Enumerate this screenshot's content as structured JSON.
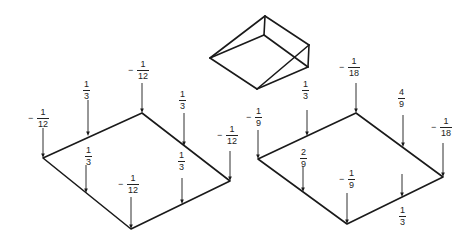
{
  "figure": {
    "wedge": {
      "vertices": {
        "top": [
          265,
          16
        ],
        "inner": [
          264,
          35
        ],
        "left": [
          210,
          58
        ],
        "bottom": [
          257,
          89
        ],
        "right_top": [
          309,
          45
        ],
        "right_bottom": [
          308,
          67
        ]
      },
      "edges": [
        [
          "left",
          "top"
        ],
        [
          "left",
          "inner"
        ],
        [
          "left",
          "bottom"
        ],
        [
          "top",
          "inner"
        ],
        [
          "top",
          "right_top"
        ],
        [
          "inner",
          "right_bottom"
        ],
        [
          "right_top",
          "right_bottom"
        ],
        [
          "bottom",
          "right_top"
        ],
        [
          "bottom",
          "right_bottom"
        ]
      ]
    },
    "plates": [
      {
        "name": "left-plate",
        "corners": {
          "left": [
            43,
            158
          ],
          "top": [
            142,
            113
          ],
          "right": [
            230,
            181
          ],
          "bottom": [
            131,
            229
          ]
        },
        "loads": [
          {
            "id": "left-corner",
            "x": 43,
            "y": 158,
            "arrow_top": 128,
            "sign": "−",
            "num": "1",
            "den": "12",
            "label_x": 28,
            "label_y": 108
          },
          {
            "id": "left-top-mid",
            "x": 88,
            "y": 136,
            "arrow_top": 100,
            "sign": "",
            "num": "1",
            "den": "3",
            "label_x": 83,
            "label_y": 80
          },
          {
            "id": "top-corner",
            "x": 142,
            "y": 113,
            "arrow_top": 83,
            "sign": "−",
            "num": "1",
            "den": "12",
            "label_x": 128,
            "label_y": 60
          },
          {
            "id": "top-right-mid",
            "x": 184,
            "y": 146,
            "arrow_top": 113,
            "sign": "",
            "num": "1",
            "den": "3",
            "label_x": 179,
            "label_y": 90
          },
          {
            "id": "right-corner",
            "x": 230,
            "y": 181,
            "arrow_top": 151,
            "sign": "−",
            "num": "1",
            "den": "12",
            "label_x": 217,
            "label_y": 125
          },
          {
            "id": "left-bottom-mid",
            "x": 86,
            "y": 193,
            "arrow_top": 165,
            "sign": "",
            "num": "1",
            "den": "3",
            "label_x": 85,
            "label_y": 146
          },
          {
            "id": "bottom-corner",
            "x": 131,
            "y": 229,
            "arrow_top": 197,
            "sign": "−",
            "num": "1",
            "den": "12",
            "label_x": 118,
            "label_y": 174
          },
          {
            "id": "bottom-right-mid",
            "x": 182,
            "y": 204,
            "arrow_top": 178,
            "sign": "",
            "num": "1",
            "den": "3",
            "label_x": 178,
            "label_y": 151
          }
        ]
      },
      {
        "name": "right-plate",
        "corners": {
          "left": [
            258,
            159
          ],
          "top": [
            356,
            113
          ],
          "right": [
            443,
            177
          ],
          "bottom": [
            347,
            224
          ]
        },
        "loads": [
          {
            "id": "left-corner",
            "x": 258,
            "y": 159,
            "arrow_top": 130,
            "sign": "−",
            "num": "1",
            "den": "9",
            "label_x": 246,
            "label_y": 107
          },
          {
            "id": "left-top-mid",
            "x": 307,
            "y": 136,
            "arrow_top": 110,
            "sign": "",
            "num": "1",
            "den": "3",
            "label_x": 302,
            "label_y": 80
          },
          {
            "id": "top-corner",
            "x": 356,
            "y": 113,
            "arrow_top": 83,
            "sign": "−",
            "num": "1",
            "den": "18",
            "label_x": 339,
            "label_y": 57
          },
          {
            "id": "top-right-mid",
            "x": 403,
            "y": 147,
            "arrow_top": 115,
            "sign": "",
            "num": "4",
            "den": "9",
            "label_x": 398,
            "label_y": 88
          },
          {
            "id": "right-corner",
            "x": 443,
            "y": 177,
            "arrow_top": 143,
            "sign": "−",
            "num": "1",
            "den": "18",
            "label_x": 431,
            "label_y": 117
          },
          {
            "id": "left-bottom-mid",
            "x": 303,
            "y": 192,
            "arrow_top": 167,
            "sign": "",
            "num": "2",
            "den": "9",
            "label_x": 300,
            "label_y": 148
          },
          {
            "id": "bottom-corner",
            "x": 347,
            "y": 224,
            "arrow_top": 193,
            "sign": "−",
            "num": "1",
            "den": "9",
            "label_x": 339,
            "label_y": 169
          },
          {
            "id": "bottom-right-mid",
            "x": 402,
            "y": 197,
            "arrow_top": 174,
            "sign": "",
            "num": "1",
            "den": "3",
            "label_x": 399,
            "label_y": 206
          }
        ]
      }
    ],
    "colors": {
      "line": "#1a1a1a",
      "text": "#222222",
      "background": "#ffffff"
    }
  }
}
